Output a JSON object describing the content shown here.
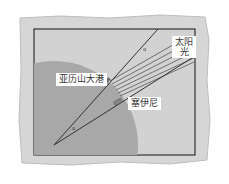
{
  "diagram": {
    "labels": {
      "sunlight": "太阳光",
      "sunlight_line1": "太阳",
      "sunlight_line2": "光",
      "alexandria": "亚历山大港",
      "syene": "塞伊尼"
    },
    "angle_symbols": {
      "top": "α",
      "center": "α"
    },
    "colors": {
      "paper": "#d8d8d8",
      "frame_bg": "#cfcfcf",
      "earth": "#a9a9a9",
      "lines": "#444444",
      "label_bg": "#ffffff"
    }
  }
}
